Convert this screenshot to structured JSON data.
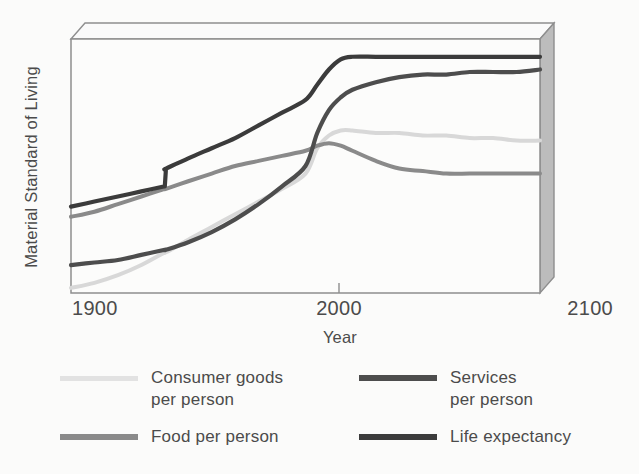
{
  "chart_data": {
    "type": "line",
    "title": "",
    "xlabel": "Year",
    "ylabel": "Material Standard of Living",
    "xlim": [
      1900,
      2100
    ],
    "ylim": [
      0,
      100
    ],
    "xticks": [
      "1900",
      "2000",
      "2100"
    ],
    "grid": false,
    "legend_position": "bottom",
    "legend_entries": [
      "Consumer goods per person",
      "Services per person",
      "Food per person",
      "Life expectancy"
    ],
    "x": [
      1900,
      1910,
      1920,
      1930,
      1940,
      1940.5,
      1950,
      1960,
      1970,
      1980,
      1990,
      2000,
      2005,
      2010,
      2015,
      2020,
      2030,
      2040,
      2050,
      2060,
      2070,
      2080,
      2090,
      2100
    ],
    "series": [
      {
        "name": "Life expectancy",
        "color": "#3b3b3b",
        "width": 4.2,
        "style": "step-at-1940",
        "values": [
          34,
          36,
          38,
          40,
          42,
          49,
          53,
          57,
          61,
          66,
          71,
          76,
          82,
          88,
          92,
          93,
          93,
          93,
          93,
          93,
          93,
          93,
          93,
          93
        ]
      },
      {
        "name": "Services per person",
        "color": "#4d4d4d",
        "width": 4.2,
        "style": "smooth",
        "values": [
          11,
          12,
          13,
          15,
          17,
          17,
          20,
          24,
          29,
          35,
          42,
          50,
          63,
          72,
          77,
          80,
          83,
          85,
          86,
          86,
          87,
          87,
          87,
          88
        ]
      },
      {
        "name": "Consumer goods per person",
        "color": "#d8d8d8",
        "width": 4.0,
        "style": "smooth",
        "values": [
          2,
          4,
          7,
          11,
          16,
          16,
          21,
          26,
          31,
          36,
          41,
          47,
          57,
          62,
          64,
          64,
          63,
          63,
          62,
          62,
          61,
          61,
          60,
          60
        ]
      },
      {
        "name": "Food per person",
        "color": "#8a8a8a",
        "width": 4.0,
        "style": "smooth",
        "values": [
          30,
          32,
          35,
          38,
          41,
          41,
          44,
          47,
          50,
          52,
          54,
          56,
          58,
          59,
          58,
          56,
          52,
          49,
          48,
          47,
          47,
          47,
          47,
          47
        ]
      }
    ]
  },
  "axes": {
    "y_label": "Material Standard of Living",
    "x_label": "Year",
    "x_tick_left": "1900",
    "x_tick_mid": "2000",
    "x_tick_right": "2100"
  },
  "legend": {
    "items": [
      {
        "label_line1": "Consumer goods",
        "label_line2": "per person",
        "color": "#dcdcdc",
        "swatch": "consumer-goods-swatch"
      },
      {
        "label_line1": "Services",
        "label_line2": "per person",
        "color": "#4d4d4d",
        "swatch": "services-swatch"
      },
      {
        "label_line1": "Food per person",
        "label_line2": "",
        "color": "#8a8a8a",
        "swatch": "food-swatch"
      },
      {
        "label_line1": "Life expectancy",
        "label_line2": "",
        "color": "#3b3b3b",
        "swatch": "life-expectancy-swatch"
      }
    ]
  },
  "style": {
    "background": "#fbfbfa",
    "panel_face": "#fcfcfb",
    "panel_side": "#b9b9b9",
    "panel_top": "#fafafa",
    "edge": "#8e8e8e",
    "text": "#4b4b4b"
  }
}
